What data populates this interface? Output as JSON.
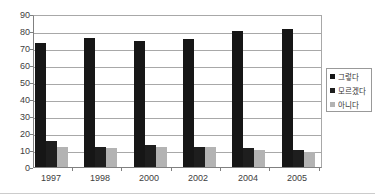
{
  "chart_data": {
    "type": "bar",
    "title": "",
    "xlabel": "",
    "ylabel": "",
    "categories": [
      "1997",
      "1998",
      "2000",
      "2002",
      "2004",
      "2005"
    ],
    "series": [
      {
        "name": "그렇다",
        "color": "#161616",
        "values": [
          73,
          76,
          74,
          75,
          80,
          81
        ]
      },
      {
        "name": "모르겠다",
        "color": "#1e1e1e",
        "values": [
          15,
          12,
          13,
          12,
          11,
          10
        ]
      },
      {
        "name": "아니다",
        "color": "#b3b3b3",
        "values": [
          12,
          11,
          12,
          12,
          10,
          9
        ]
      }
    ],
    "ylim": [
      0,
      90
    ],
    "ytick_step": 10,
    "ytick_labels": [
      "0",
      "10",
      "20",
      "30",
      "40",
      "50",
      "60",
      "70",
      "80",
      "90"
    ],
    "grid": true,
    "legend_position": "right"
  },
  "style": {
    "gridline_color": "#a8a8a8",
    "axis_color": "#808080",
    "plot_border_color": "#a8a8a8",
    "background_color": "#ffffff",
    "label_color": "#404040"
  }
}
